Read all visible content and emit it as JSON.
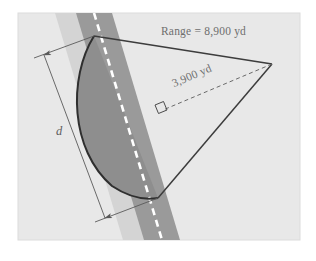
{
  "figure": {
    "panel": {
      "background_color": "#e8e8e8",
      "border_color": "#dcdcdc"
    },
    "page_background": "#ffffff",
    "labels": {
      "range": "Range = 8,900 yd",
      "perpendicular": "3,900 yd",
      "width": "d"
    },
    "colors": {
      "road_band_light": "#d4d4d4",
      "road_band_dark": "#9a9a9a",
      "sector_fill": "#8e8e8e",
      "centerline": "#ffffff",
      "outline": "#3c3c3c",
      "dimension_line": "#606060",
      "text": "#6e6e6e"
    },
    "geometry": {
      "apex_top": [
        94,
        36
      ],
      "apex_bottom": [
        158,
        198
      ],
      "vertex_right": [
        272,
        64
      ],
      "right_angle_foot": [
        163,
        110
      ],
      "road_heading_degrees": 21,
      "centerline_style": "white-dashed"
    },
    "measurements": [
      {
        "name": "range",
        "value": 8900,
        "unit": "yd",
        "style": "solid-edge"
      },
      {
        "name": "perpendicular-distance",
        "value": 3900,
        "unit": "yd",
        "style": "dashed-leader"
      },
      {
        "name": "width",
        "value": "d",
        "unit": "",
        "style": "dimension-arrow"
      }
    ]
  }
}
